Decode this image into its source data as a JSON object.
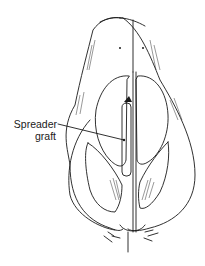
{
  "figure": {
    "stroke_color": "#1a1a1a",
    "background": "#ffffff"
  },
  "labels": {
    "spreader_graft": {
      "line1": "Spreader",
      "line2": "graft"
    }
  }
}
